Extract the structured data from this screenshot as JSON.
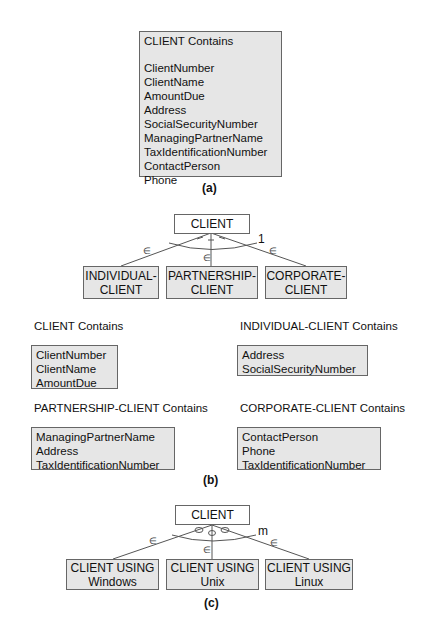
{
  "panel_a": {
    "title": "CLIENT Contains",
    "attributes": [
      "ClientNumber",
      "ClientName",
      "AmountDue",
      "Address",
      "SocialSecurityNumber",
      "ManagingPartnerName",
      "TaxIdentificationNumber",
      "ContactPerson",
      "Phone"
    ],
    "caption": "(a)"
  },
  "panel_b": {
    "supertype": "CLIENT",
    "constraint_label": "1",
    "membership_symbol": "∈",
    "subtypes": [
      {
        "line1": "INDIVIDUAL-",
        "line2": "CLIENT"
      },
      {
        "line1": "PARTNERSHIP-",
        "line2": "CLIENT"
      },
      {
        "line1": "CORPORATE-",
        "line2": "CLIENT"
      }
    ],
    "groups": [
      {
        "heading": "CLIENT Contains",
        "attributes": [
          "ClientNumber",
          "ClientName",
          "AmountDue"
        ]
      },
      {
        "heading": "INDIVIDUAL-CLIENT Contains",
        "attributes": [
          "Address",
          "SocialSecurityNumber"
        ]
      },
      {
        "heading": "PARTNERSHIP-CLIENT Contains",
        "attributes": [
          "ManagingPartnerName",
          "Address",
          "TaxIdentificationNumber"
        ]
      },
      {
        "heading": "CORPORATE-CLIENT Contains",
        "attributes": [
          "ContactPerson",
          "Phone",
          "TaxIdentificationNumber"
        ]
      }
    ],
    "caption": "(b)"
  },
  "panel_c": {
    "supertype": "CLIENT",
    "constraint_label": "m",
    "membership_symbol": "∈",
    "subtypes": [
      {
        "line1": "CLIENT USING",
        "line2": "Windows"
      },
      {
        "line1": "CLIENT USING",
        "line2": "Unix"
      },
      {
        "line1": "CLIENT USING",
        "line2": "Linux"
      }
    ],
    "caption": "(c)"
  }
}
